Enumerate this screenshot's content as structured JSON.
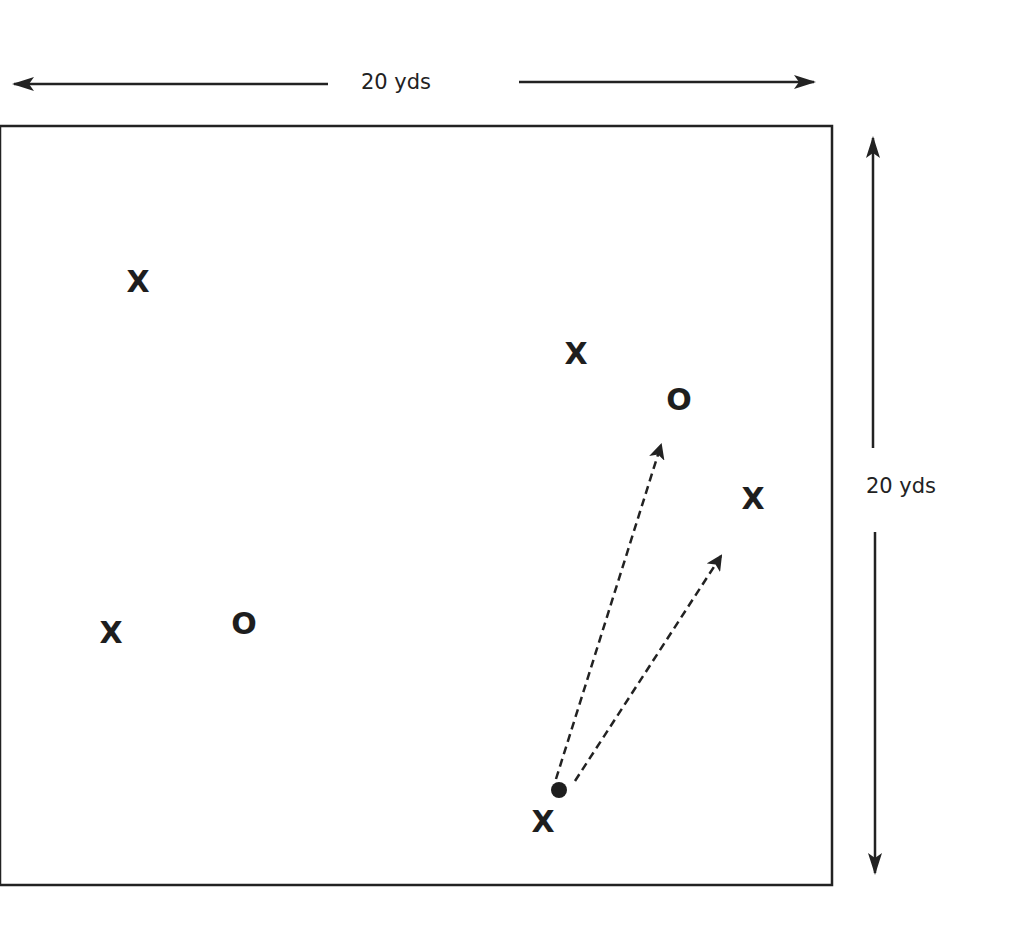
{
  "diagram": {
    "type": "drill-field",
    "field": {
      "x": 0,
      "y": 126,
      "width": 832,
      "height": 759,
      "stroke": "#222222"
    },
    "dimensions": {
      "width_label": "20 yds",
      "height_label": "20 yds"
    },
    "players": [
      {
        "id": "x1",
        "symbol": "X",
        "team": "offense",
        "x": 138,
        "y": 281
      },
      {
        "id": "x2",
        "symbol": "X",
        "team": "offense",
        "x": 576,
        "y": 353
      },
      {
        "id": "o1",
        "symbol": "O",
        "team": "defense",
        "x": 679,
        "y": 399
      },
      {
        "id": "x3",
        "symbol": "X",
        "team": "offense",
        "x": 753,
        "y": 498
      },
      {
        "id": "x4",
        "symbol": "X",
        "team": "offense",
        "x": 111,
        "y": 632
      },
      {
        "id": "o2",
        "symbol": "O",
        "team": "defense",
        "x": 244,
        "y": 623
      },
      {
        "id": "x5",
        "symbol": "X",
        "team": "offense",
        "x": 543,
        "y": 821,
        "has_ball": true
      }
    ],
    "ball": {
      "x": 559,
      "y": 790,
      "r": 8
    },
    "passes": [
      {
        "from": "x5",
        "to": "x2",
        "x1": 556,
        "y1": 779,
        "x2": 661,
        "y2": 445,
        "style": "dashed"
      },
      {
        "from": "x5",
        "to": "x3",
        "x1": 575,
        "y1": 781,
        "x2": 721,
        "y2": 556,
        "style": "dashed"
      }
    ]
  }
}
